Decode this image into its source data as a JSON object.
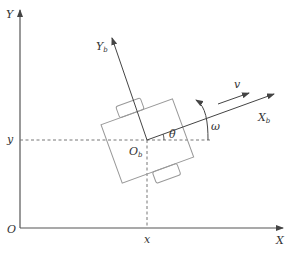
{
  "diagram": {
    "title": "",
    "colors": {
      "axis": "#555555",
      "robot_outline": "#999999",
      "dashed": "#777777",
      "text": "#333333"
    },
    "world_frame": {
      "origin_label": "O",
      "x_axis_label": "X",
      "y_axis_label": "Y"
    },
    "body_frame": {
      "origin_label": "O",
      "origin_sub": "b",
      "x_axis_label": "X",
      "x_axis_sub": "b",
      "y_axis_label": "Y",
      "y_axis_sub": "b"
    },
    "position": {
      "x_label": "x",
      "y_label": "y"
    },
    "heading_angle_label": "θ",
    "velocity_label": "v",
    "angular_velocity_label": "ω"
  }
}
